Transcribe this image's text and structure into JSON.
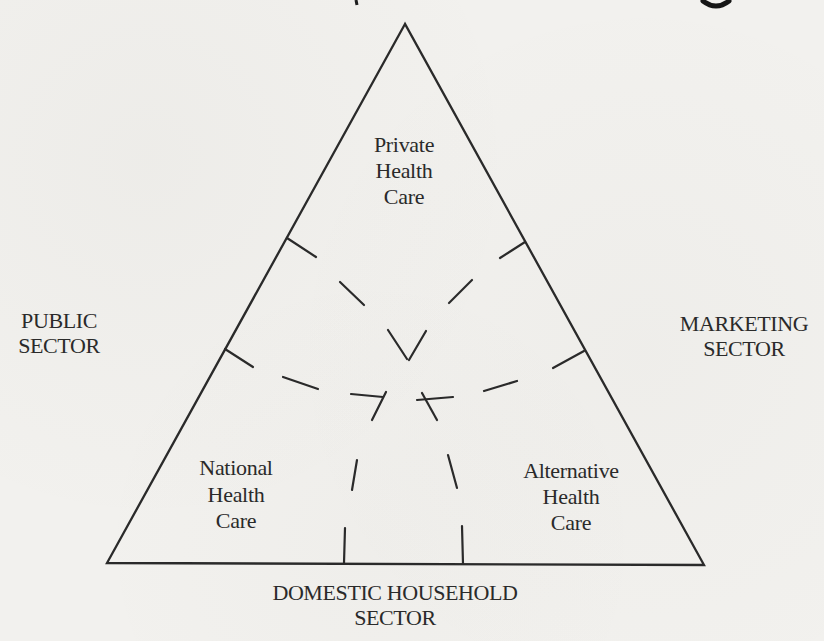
{
  "page": {
    "background": "#f2f1ee",
    "ink": "#2a2a2a"
  },
  "diagram": {
    "type": "triangle-sector-diagram",
    "inner_regions": {
      "top": {
        "l1": "Private",
        "l2": "Health",
        "l3": "Care"
      },
      "bottom_left": {
        "l1": "National",
        "l2": "Health",
        "l3": "Care"
      },
      "bottom_right": {
        "l1": "Alternative",
        "l2": "Health",
        "l3": "Care"
      }
    },
    "outer_sectors": {
      "left": {
        "l1": "PUBLIC",
        "l2": "SECTOR"
      },
      "right": {
        "l1": "MARKETING",
        "l2": "SECTOR"
      },
      "bottom": {
        "l1": "DOMESTIC HOUSEHOLD",
        "l2": "SECTOR"
      }
    },
    "geometry": {
      "triangle_points": "405,24 107,563 704,565",
      "dash_segments": [
        [
          287,
          238,
          316,
          257
        ],
        [
          340,
          282,
          364,
          305
        ],
        [
          388,
          330,
          407,
          359
        ],
        [
          525,
          242,
          500,
          258
        ],
        [
          472,
          280,
          449,
          303
        ],
        [
          426,
          331,
          409,
          360
        ],
        [
          225,
          349,
          253,
          367
        ],
        [
          283,
          377,
          318,
          389
        ],
        [
          351,
          394,
          383,
          397
        ],
        [
          417,
          400,
          453,
          397
        ],
        [
          484,
          391,
          517,
          381
        ],
        [
          553,
          368,
          584,
          351
        ],
        [
          386,
          392,
          372,
          420
        ],
        [
          357,
          460,
          352,
          490
        ],
        [
          345,
          528,
          344,
          563
        ],
        [
          422,
          393,
          437,
          420
        ],
        [
          448,
          455,
          457,
          488
        ],
        [
          462,
          526,
          463,
          564
        ]
      ],
      "crop_fragment_tick": [
        356,
        0,
        357,
        5
      ],
      "crop_fragment_crescent": "M703,1 Q716,11 729,1"
    }
  }
}
